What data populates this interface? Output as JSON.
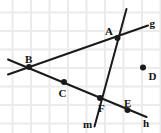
{
  "figure": {
    "width": 161,
    "height": 133,
    "background_color": "#ffffff",
    "ink_color": "#1a1a1a",
    "grid": {
      "visible": true,
      "color": "#ebebeb",
      "cell_size": 18.5,
      "offset_x": 12.5,
      "offset_y": 12.5
    }
  },
  "points": [
    {
      "id": "A",
      "label": "A",
      "x": 117.5,
      "y": 38.0,
      "label_x": 105.0,
      "label_y": 26.0,
      "radius": 3.0
    },
    {
      "id": "B",
      "label": "B",
      "x": 29.0,
      "y": 67.0,
      "label_x": 25.0,
      "label_y": 54.0,
      "radius": 3.0
    },
    {
      "id": "C",
      "label": "C",
      "x": 64.0,
      "y": 82.0,
      "label_x": 58.5,
      "label_y": 88.0,
      "radius": 3.0
    },
    {
      "id": "D",
      "label": "D",
      "x": 143.0,
      "y": 67.5,
      "label_x": 148.5,
      "label_y": 71.0,
      "radius": 3.0
    },
    {
      "id": "E",
      "label": "E",
      "x": 127.5,
      "y": 110.0,
      "label_x": 124.0,
      "label_y": 98.0,
      "radius": 3.0
    },
    {
      "id": "F",
      "label": "F",
      "x": 100.0,
      "y": 98.0,
      "label_x": 98.0,
      "label_y": 103.0,
      "radius": 3.0
    }
  ],
  "lines": [
    {
      "id": "g",
      "label": "g",
      "x1": 8.0,
      "y1": 74.5,
      "x2": 148.0,
      "y2": 25.5,
      "label_x": 149.5,
      "label_y": 18.0,
      "passes_through": [
        "B",
        "A"
      ],
      "stroke_width": 2.0
    },
    {
      "id": "h",
      "label": "h",
      "x1": 8.0,
      "y1": 59.5,
      "x2": 146.5,
      "y2": 117.0,
      "label_x": 143.0,
      "label_y": 118.0,
      "passes_through": [
        "B",
        "C",
        "F",
        "E"
      ],
      "stroke_width": 2.0
    },
    {
      "id": "m",
      "label": "m",
      "x1": 126.5,
      "y1": 9.0,
      "x2": 94.5,
      "y2": 126.5,
      "label_x": 83.0,
      "label_y": 118.5,
      "passes_through": [
        "A",
        "F"
      ],
      "stroke_width": 2.0
    }
  ]
}
